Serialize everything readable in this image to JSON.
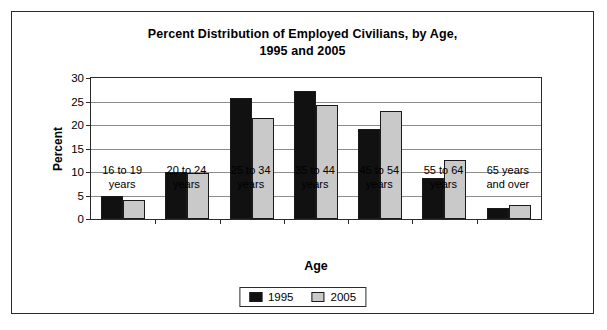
{
  "chart_data": {
    "type": "bar",
    "title": "Percent Distribution of Employed Civilians, by Age, 1995 and 2005",
    "title_lines": [
      "Percent Distribution of Employed Civilians, by Age,",
      "1995 and 2005"
    ],
    "xlabel": "Age",
    "ylabel": "Percent",
    "ylim": [
      0,
      30
    ],
    "yticks": [
      0,
      5,
      10,
      15,
      20,
      25,
      30
    ],
    "ytick_labels": [
      "0",
      "5",
      "10",
      "15",
      "20",
      "25",
      "30"
    ],
    "grid": "horizontal",
    "legend_position": "bottom-center",
    "categories": [
      "16 to 19 years",
      "20 to 24 years",
      "25 to 34 years",
      "35 to 44 years",
      "45 to 54 years",
      "55 to 64 years",
      "65 years and over"
    ],
    "category_lines": [
      [
        "16 to 19",
        "years"
      ],
      [
        "20 to 24",
        "years"
      ],
      [
        "25 to 34",
        "years"
      ],
      [
        "35 to 44",
        "years"
      ],
      [
        "45 to 54",
        "years"
      ],
      [
        "55 to 64",
        "years"
      ],
      [
        "65 years",
        "and over"
      ]
    ],
    "series": [
      {
        "name": "1995",
        "color": "#111111",
        "values": [
          5.0,
          10.0,
          25.7,
          27.2,
          19.2,
          8.8,
          2.3
        ]
      },
      {
        "name": "2005",
        "color": "#c9c9c9",
        "values": [
          4.1,
          9.7,
          21.5,
          24.2,
          23.0,
          12.5,
          3.0
        ]
      }
    ]
  },
  "legend": {
    "items": [
      {
        "label": "1995"
      },
      {
        "label": "2005"
      }
    ]
  },
  "colors": {
    "series_1995": "#111111",
    "series_2005": "#c9c9c9",
    "axis": "#2b2b2b",
    "gridline": "#8c8c8c",
    "background": "#ffffff"
  }
}
